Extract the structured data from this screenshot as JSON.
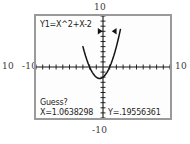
{
  "device": {
    "type": "graphing-calculator-screen",
    "mode_prompt": "Guess?"
  },
  "outer_labels": {
    "y_max": "10",
    "x_min_outer": "10",
    "x_min": "-10",
    "x_max": "10",
    "y_min": "-10"
  },
  "equation": {
    "label": "Y1=X^2+X-2"
  },
  "cursor_readout": {
    "prompt": "Guess?",
    "x_label": "X=1.0638298",
    "y_label": "Y=.19556361",
    "x_value": 1.0638298,
    "y_value": 0.19556361
  },
  "markers": {
    "left_bound_glyph": "right-triangle",
    "right_bound_glyph": "left-triangle",
    "left_bound_x": -0.45,
    "right_bound_x": 1.7,
    "bound_y": 7.0
  },
  "colors": {
    "screen_background": "#fdfdfd",
    "screen_border": "#9a9a9a",
    "curve": "#141414",
    "axis": "#141414",
    "text": "#1c1c1c",
    "outer_text": "#3a3a3a"
  },
  "chart_data": {
    "type": "line",
    "title": "",
    "xlabel": "",
    "ylabel": "",
    "function": "Y1 = X^2 + X - 2",
    "xlim": [
      -10,
      10
    ],
    "ylim": [
      -10,
      10
    ],
    "xtick_step": 1,
    "ytick_step": 1,
    "grid": false,
    "legend": false,
    "roots": [
      -2,
      1
    ],
    "vertex": [
      -0.5,
      -2.25
    ],
    "series": [
      {
        "name": "Y1=X^2+X-2",
        "x": [
          -3.0,
          -2.8,
          -2.6,
          -2.4,
          -2.2,
          -2.0,
          -1.8,
          -1.6,
          -1.4,
          -1.2,
          -1.0,
          -0.8,
          -0.6,
          -0.4,
          -0.2,
          0.0,
          0.2,
          0.4,
          0.6,
          0.8,
          1.0,
          1.2,
          1.4,
          1.6,
          1.8,
          2.0,
          2.2,
          2.4,
          2.6
        ],
        "values": [
          4.0,
          3.04,
          2.16,
          1.36,
          0.64,
          0.0,
          -0.56,
          -1.04,
          -1.44,
          -1.76,
          -2.0,
          -2.16,
          -2.24,
          -2.24,
          -2.16,
          -2.0,
          -1.76,
          -1.44,
          -1.04,
          -0.56,
          0.0,
          0.64,
          1.36,
          2.16,
          3.04,
          4.0,
          5.04,
          6.16,
          7.36
        ]
      }
    ],
    "cursor_point": {
      "x": 1.0638298,
      "y": 0.19556361
    }
  }
}
